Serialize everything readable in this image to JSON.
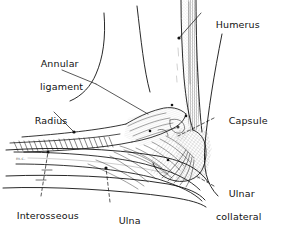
{
  "figure": {
    "view": "lateral view of right elbow, flexed",
    "background_color": "#ffffff",
    "ink_color": "#111111",
    "width": 286,
    "height": 233
  },
  "labels": {
    "humerus": "Humerus",
    "annular_line1": "Annular",
    "annular_line2": "ligament",
    "radius": "Radius",
    "capsule": "Capsule",
    "ulnar_line1": "Ulnar",
    "ulnar_line2": "collateral",
    "ulnar_line3": "ligament",
    "interosseous_line1": "Interosseous",
    "interosseous_line2": "ligament",
    "ulna": "Ulna"
  },
  "signature": "m.c.",
  "leaders": {
    "humerus": "solid line with dot terminal on humeral shaft",
    "annular": "solid line with dot terminal at radial head",
    "radius": "solid line with dot terminal on radial shaft",
    "capsule": "dashed line to joint capsule",
    "ulnar_collateral": "dashed line to medial side of joint",
    "interosseous": "dashed line with cross ticks to interosseous membrane",
    "ulna": "dashed line with dot terminal on ulnar shaft"
  }
}
